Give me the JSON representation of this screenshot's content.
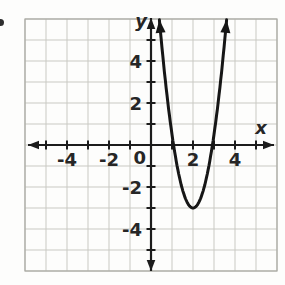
{
  "chart_data": {
    "type": "line",
    "title": "",
    "x_label": "x",
    "y_label": "y",
    "x_range": [
      -6,
      6
    ],
    "y_range": [
      -6,
      6
    ],
    "grid": true,
    "tick_step": 1,
    "axis_ticks_min": -5,
    "axis_ticks_max": 5,
    "x_tick_labels": [
      {
        "value": -4,
        "label": "-4"
      },
      {
        "value": -2,
        "label": "-2"
      },
      {
        "value": 2,
        "label": "2"
      },
      {
        "value": 4,
        "label": "4"
      }
    ],
    "y_tick_labels": [
      {
        "value": 4,
        "label": "4"
      },
      {
        "value": 2,
        "label": "2"
      },
      {
        "value": -2,
        "label": "-2"
      },
      {
        "value": -4,
        "label": "-4"
      }
    ],
    "origin_label": "0",
    "series": [
      {
        "name": "parabola",
        "kind": "parabola",
        "opens": "up",
        "vertex": [
          2,
          -3
        ],
        "x_intercepts": [
          1,
          3
        ],
        "a": 3.5,
        "x_min": 0.4,
        "x_max": 3.6,
        "arrows": "both-ends"
      }
    ],
    "axis_color": "#1c1c1c",
    "curve_color": "#161616",
    "grid_color": "#c9c9c3",
    "grid_border_color": "#a8a8a2",
    "label_color": "#262626"
  }
}
